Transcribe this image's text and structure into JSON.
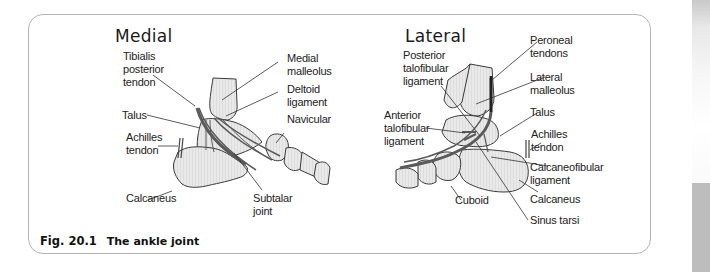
{
  "figure": {
    "number": "Fig. 20.1",
    "caption": "The ankle joint"
  },
  "panels": {
    "medial": {
      "title": "Medial",
      "labels": {
        "tibialis_posterior": "Tibialis\nposterior\ntendon",
        "medial_malleolus": "Medial\nmalleolus",
        "deltoid_ligament": "Deltoid\nligament",
        "talus": "Talus",
        "navicular": "Navicular",
        "achilles": "Achilles\ntendon",
        "calcaneus": "Calcaneus",
        "subtalar_joint": "Subtalar\njoint"
      }
    },
    "lateral": {
      "title": "Lateral",
      "labels": {
        "posterior_talofibular": "Posterior\ntalofibular\nligament",
        "peroneal_tendons": "Peroneal\ntendons",
        "lateral_malleolus": "Lateral\nmalleolus",
        "anterior_talofibular": "Anterior\ntalofibular\nligament",
        "talus": "Talus",
        "achilles": "Achilles\ntendon",
        "calcaneofibular": "Calcaneofibular\nligament",
        "cuboid": "Cuboid",
        "calcaneus": "Calcaneus",
        "sinus_tarsi": "Sinus tarsi"
      }
    }
  },
  "colors": {
    "bone_fill": "#e6e6e6",
    "bone_stroke": "#3a3a3a",
    "tendon": "#555555",
    "frame_border": "#b4b4b4"
  }
}
